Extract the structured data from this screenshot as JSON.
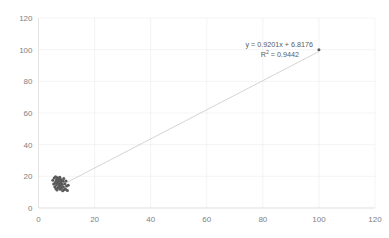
{
  "chart_data": {
    "type": "scatter",
    "title": "",
    "xlabel": "",
    "ylabel": "",
    "xlim": [
      0,
      120
    ],
    "ylim": [
      0,
      120
    ],
    "xticks": [
      0,
      20,
      40,
      60,
      80,
      100,
      120
    ],
    "yticks": [
      0,
      20,
      40,
      60,
      80,
      100,
      120
    ],
    "grid": true,
    "legend": false,
    "marker_color": "#595959",
    "trendline_color": "#c9c9c9",
    "gridline_color": "#e8e8e8",
    "annotation": {
      "equation": "y = 0.9201x + 6.8176",
      "equation_prefix": "y = 0.9201x + 6.8176",
      "r_squared_prefix": "R",
      "r_squared_sup": "2",
      "r_squared_value": " = 0.9442",
      "r_squared_full": "R² = 0.9442",
      "slope": 0.9201,
      "intercept": 6.8176,
      "r2": 0.9442
    },
    "trendline": {
      "x_start": 10,
      "y_start": 16.02,
      "x_end": 100,
      "y_end": 98.83
    },
    "series": [
      {
        "name": "Series 1",
        "points": [
          [
            5.1,
            17.6
          ],
          [
            5.4,
            15.2
          ],
          [
            5.6,
            18.9
          ],
          [
            5.8,
            13.4
          ],
          [
            6.0,
            16.1
          ],
          [
            6.1,
            19.8
          ],
          [
            6.2,
            12.2
          ],
          [
            6.3,
            17.0
          ],
          [
            6.4,
            14.5
          ],
          [
            6.5,
            18.2
          ],
          [
            6.6,
            11.3
          ],
          [
            6.7,
            15.8
          ],
          [
            6.8,
            19.1
          ],
          [
            6.9,
            13.0
          ],
          [
            7.0,
            16.7
          ],
          [
            7.1,
            18.5
          ],
          [
            7.2,
            12.8
          ],
          [
            7.3,
            15.0
          ],
          [
            7.4,
            17.9
          ],
          [
            7.5,
            14.1
          ],
          [
            7.6,
            19.4
          ],
          [
            7.7,
            11.9
          ],
          [
            7.8,
            16.4
          ],
          [
            7.9,
            13.7
          ],
          [
            8.0,
            18.0
          ],
          [
            8.1,
            15.5
          ],
          [
            8.2,
            12.5
          ],
          [
            8.3,
            17.3
          ],
          [
            8.5,
            14.8
          ],
          [
            8.6,
            10.9
          ],
          [
            8.8,
            16.9
          ],
          [
            8.9,
            13.2
          ],
          [
            9.0,
            18.7
          ],
          [
            9.2,
            11.6
          ],
          [
            9.4,
            15.3
          ],
          [
            9.6,
            12.0
          ],
          [
            9.8,
            17.1
          ],
          [
            10.0,
            13.9
          ],
          [
            10.3,
            11.0
          ],
          [
            10.6,
            14.3
          ],
          [
            100.0,
            100.0
          ]
        ]
      }
    ]
  }
}
